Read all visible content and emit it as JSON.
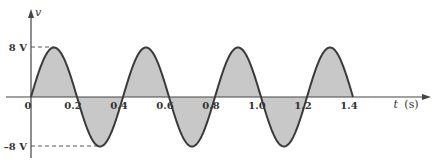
{
  "chart_data": {
    "type": "line",
    "title": "",
    "xlabel": "t (s)",
    "ylabel": "v",
    "xlabel_var": "t",
    "xlabel_unit": "(s)",
    "function": "v(t) = 8 sin(2π·t/0.4)",
    "amplitude": 8,
    "period": 0.4,
    "x_range": [
      0,
      1.4
    ],
    "ylim": [
      -8,
      8
    ],
    "x_ticks": [
      "0",
      "0.2",
      "0.4",
      "0.6",
      "0.8",
      "1.0",
      "1.2",
      "1.4"
    ],
    "y_ticks": [
      "8 V",
      "–8 V"
    ],
    "x": [
      0,
      0.1,
      0.2,
      0.3,
      0.4,
      0.5,
      0.6,
      0.7,
      0.8,
      0.9,
      1.0,
      1.1,
      1.2,
      1.3,
      1.4
    ],
    "series": [
      {
        "name": "v",
        "values": [
          0,
          8,
          0,
          -8,
          0,
          8,
          0,
          -8,
          0,
          8,
          0,
          -8,
          0,
          8,
          0
        ]
      }
    ],
    "fill": "area between curve and t-axis shaded gray",
    "grid": false,
    "legend": false,
    "annotations": [
      "dashed line from 8 V to first peak",
      "dashed line from –8 V to first trough"
    ]
  },
  "colors": {
    "curve": "#3a3a3a",
    "fill": "#c8c8c8",
    "axis": "#444444",
    "text": "#333333"
  }
}
